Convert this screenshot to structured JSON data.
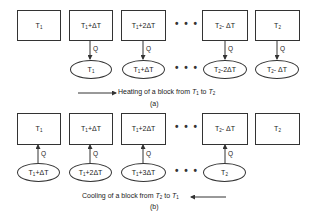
{
  "part_a": {
    "boxes": [
      {
        "main": "T",
        "sub": "1",
        "rest": ""
      },
      {
        "main": "T",
        "sub": "1",
        "rest": "+ΔT"
      },
      {
        "main": "T",
        "sub": "1",
        "rest": "+2ΔT"
      },
      {
        "main": "T",
        "sub": "2",
        "rest": "- ΔT"
      },
      {
        "main": "T",
        "sub": "2",
        "rest": ""
      }
    ],
    "ellipses": [
      {
        "main": "T",
        "sub": "1",
        "rest": ""
      },
      {
        "main": "T",
        "sub": "1",
        "rest": "+ΔT"
      },
      {
        "main": "T",
        "sub": "2",
        "rest": "-2ΔT"
      },
      {
        "main": "T",
        "sub": "2",
        "rest": "- ΔT"
      }
    ],
    "flow_label": "Q",
    "ellipsis": "• • •",
    "caption": {
      "text": "Heating of a block from ",
      "from_main": "T",
      "from_sub": "1",
      "to_word": " to ",
      "to_main": "T",
      "to_sub": "2"
    },
    "label": "(a)"
  },
  "part_b": {
    "boxes": [
      {
        "main": "T",
        "sub": "1",
        "rest": ""
      },
      {
        "main": "T",
        "sub": "1",
        "rest": "+ΔT"
      },
      {
        "main": "T",
        "sub": "1",
        "rest": "+2ΔT"
      },
      {
        "main": "T",
        "sub": "2",
        "rest": "- ΔT"
      },
      {
        "main": "T",
        "sub": "2",
        "rest": ""
      }
    ],
    "ellipses": [
      {
        "main": "T",
        "sub": "1",
        "rest": "+ΔT"
      },
      {
        "main": "T",
        "sub": "1",
        "rest": "+2ΔT"
      },
      {
        "main": "T",
        "sub": "1",
        "rest": "+3ΔT"
      },
      {
        "main": "T",
        "sub": "2",
        "rest": ""
      }
    ],
    "flow_label": "Q",
    "ellipsis": "• • •",
    "caption": {
      "text": "Cooling of a block from ",
      "from_main": "T",
      "from_sub": "2",
      "to_word": " to ",
      "to_main": "T",
      "to_sub": "1"
    },
    "label": "(b)"
  }
}
